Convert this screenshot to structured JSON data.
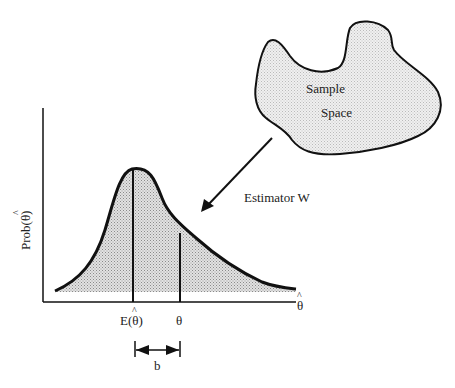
{
  "diagram": {
    "sample_space": {
      "line1": "Sample",
      "line2": "Space"
    },
    "arrow_label": "Estimator W",
    "y_axis_label": "Prob(",
    "y_axis_label_symbol": "θ",
    "y_axis_label_hat": "^",
    "y_axis_label_close": ")",
    "x_axis_symbol": "θ",
    "x_axis_hat": "^",
    "expected_label_prefix": "E(",
    "expected_label_symbol": "θ",
    "expected_label_hat": "^",
    "expected_label_close": ")",
    "theta_label": "θ",
    "bias_label": "b",
    "fill_color": "#bdbdbd",
    "stroke_color": "#111111"
  }
}
